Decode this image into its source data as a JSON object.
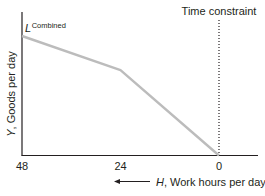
{
  "chart_data": {
    "type": "line",
    "title": "",
    "xlabel_var": "H",
    "xlabel_rest": ", Work hours per day",
    "ylabel_var": "Y",
    "ylabel_rest": ", Goods per day",
    "x_reversed": true,
    "xlim": [
      48,
      -8
    ],
    "ylim": [
      0,
      1
    ],
    "x_ticks": [
      {
        "value": 48,
        "label": "48"
      },
      {
        "value": 24,
        "label": "24"
      },
      {
        "value": 0,
        "label": "0"
      }
    ],
    "series": [
      {
        "name": "L Combined",
        "label_main": "L",
        "label_super": "Combined",
        "color": "#bcbcbc",
        "points": [
          {
            "x": 48,
            "y": 0.7
          },
          {
            "x": 24,
            "y": 0.5
          },
          {
            "x": 0,
            "y": 0.0
          }
        ]
      }
    ],
    "annotations": [
      {
        "type": "vline",
        "x": 0,
        "style": "dotted",
        "label": "Time constraint"
      }
    ],
    "grid": false
  }
}
